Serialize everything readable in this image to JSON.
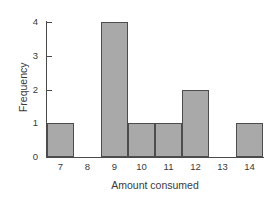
{
  "chart_data": {
    "type": "bar",
    "title": "",
    "xlabel": "Amount consumed",
    "ylabel": "Frequency",
    "categories": [
      "7",
      "8",
      "9",
      "10",
      "11",
      "12",
      "13",
      "14"
    ],
    "values": [
      1,
      0,
      4,
      1,
      1,
      2,
      0,
      1
    ],
    "xlim": [
      6.5,
      14.5
    ],
    "ylim": [
      0,
      4
    ],
    "y_ticks": [
      "0",
      "1",
      "2",
      "3",
      "4"
    ],
    "x_ticks": [
      "7",
      "8",
      "9",
      "10",
      "11",
      "12",
      "13",
      "14"
    ],
    "grid": false,
    "legend": null,
    "bar_color": "#a9a9a9",
    "bar_edge_color": "#4d4d4d",
    "axis_color": "#4a4a4a",
    "background_color": "#ffffff"
  }
}
